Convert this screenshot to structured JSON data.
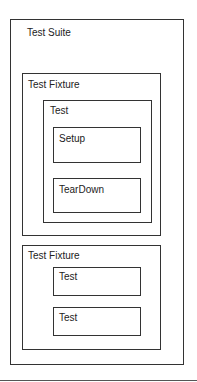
{
  "suite": {
    "label": "Test Suite",
    "fixtures": [
      {
        "label": "Test Fixture",
        "test": {
          "label": "Test",
          "children": [
            {
              "label": "Setup"
            },
            {
              "label": "TearDown"
            }
          ]
        }
      },
      {
        "label": "Test Fixture",
        "tests": [
          {
            "label": "Test"
          },
          {
            "label": "Test"
          }
        ]
      }
    ]
  }
}
